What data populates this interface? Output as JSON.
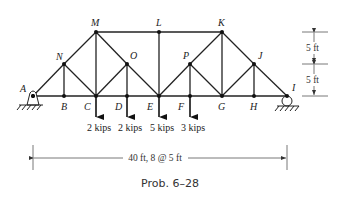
{
  "figure": {
    "caption": "Prob. 6–28",
    "span_dimension": "40 ft, 8 @ 5 ft",
    "height_dimensions": [
      "5 ft",
      "5 ft"
    ]
  },
  "nodes": [
    {
      "id": "A",
      "x": 33,
      "y": 96,
      "label_dx": -13,
      "label_dy": -4
    },
    {
      "id": "B",
      "x": 64,
      "y": 96,
      "label_dx": -3,
      "label_dy": 14
    },
    {
      "id": "C",
      "x": 96,
      "y": 96,
      "label_dx": -12,
      "label_dy": 14
    },
    {
      "id": "D",
      "x": 127,
      "y": 96,
      "label_dx": -12,
      "label_dy": 14
    },
    {
      "id": "E",
      "x": 159,
      "y": 96,
      "label_dx": -12,
      "label_dy": 14
    },
    {
      "id": "F",
      "x": 190,
      "y": 96,
      "label_dx": -12,
      "label_dy": 14
    },
    {
      "id": "G",
      "x": 222,
      "y": 96,
      "label_dx": -4,
      "label_dy": 14
    },
    {
      "id": "H",
      "x": 254,
      "y": 96,
      "label_dx": -4,
      "label_dy": 14
    },
    {
      "id": "I",
      "x": 287,
      "y": 96,
      "label_dx": 5,
      "label_dy": -5
    },
    {
      "id": "N",
      "x": 64,
      "y": 64,
      "label_dx": -8,
      "label_dy": -4
    },
    {
      "id": "M",
      "x": 96,
      "y": 32,
      "label_dx": -5,
      "label_dy": -6
    },
    {
      "id": "O",
      "x": 127,
      "y": 64,
      "label_dx": 3,
      "label_dy": -5
    },
    {
      "id": "L",
      "x": 159,
      "y": 32,
      "label_dx": -3,
      "label_dy": -6
    },
    {
      "id": "K",
      "x": 222,
      "y": 32,
      "label_dx": -4,
      "label_dy": -6
    },
    {
      "id": "P",
      "x": 190,
      "y": 64,
      "label_dx": -7,
      "label_dy": -5
    },
    {
      "id": "J",
      "x": 254,
      "y": 64,
      "label_dx": 4,
      "label_dy": -5
    }
  ],
  "members": [
    [
      "A",
      "I"
    ],
    [
      "A",
      "N"
    ],
    [
      "N",
      "M"
    ],
    [
      "M",
      "K"
    ],
    [
      "K",
      "J"
    ],
    [
      "J",
      "I"
    ],
    [
      "N",
      "B"
    ],
    [
      "N",
      "C"
    ],
    [
      "M",
      "C"
    ],
    [
      "M",
      "O"
    ],
    [
      "O",
      "E"
    ],
    [
      "O",
      "C"
    ],
    [
      "O",
      "D"
    ],
    [
      "L",
      "E"
    ],
    [
      "E",
      "P"
    ],
    [
      "P",
      "K"
    ],
    [
      "P",
      "F"
    ],
    [
      "P",
      "G"
    ],
    [
      "K",
      "G"
    ],
    [
      "J",
      "G"
    ],
    [
      "J",
      "H"
    ]
  ],
  "loads": [
    {
      "node": "C",
      "label": "2 kips"
    },
    {
      "node": "D",
      "label": "2 kips"
    },
    {
      "node": "E",
      "label": "5 kips"
    },
    {
      "node": "F",
      "label": "3 kips"
    }
  ],
  "supports": [
    {
      "node": "A",
      "type": "pin"
    },
    {
      "node": "I",
      "type": "roller"
    }
  ]
}
